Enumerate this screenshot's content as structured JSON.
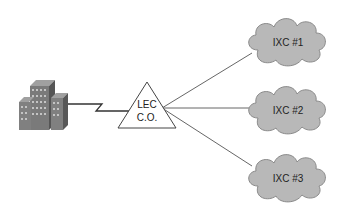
{
  "diagram": {
    "building": {
      "label": "Customer premises building"
    },
    "lec": {
      "line1": "LEC",
      "line2": "C.O."
    },
    "ixcs": [
      {
        "label": "IXC #1"
      },
      {
        "label": "IXC #2"
      },
      {
        "label": "IXC #3"
      }
    ]
  },
  "colors": {
    "cloud_fill": "#b8b8b8",
    "cloud_stroke": "#8a8a8a",
    "building_light": "#8c8c8c",
    "building_dark": "#5e5e5e",
    "line": "#333333"
  }
}
